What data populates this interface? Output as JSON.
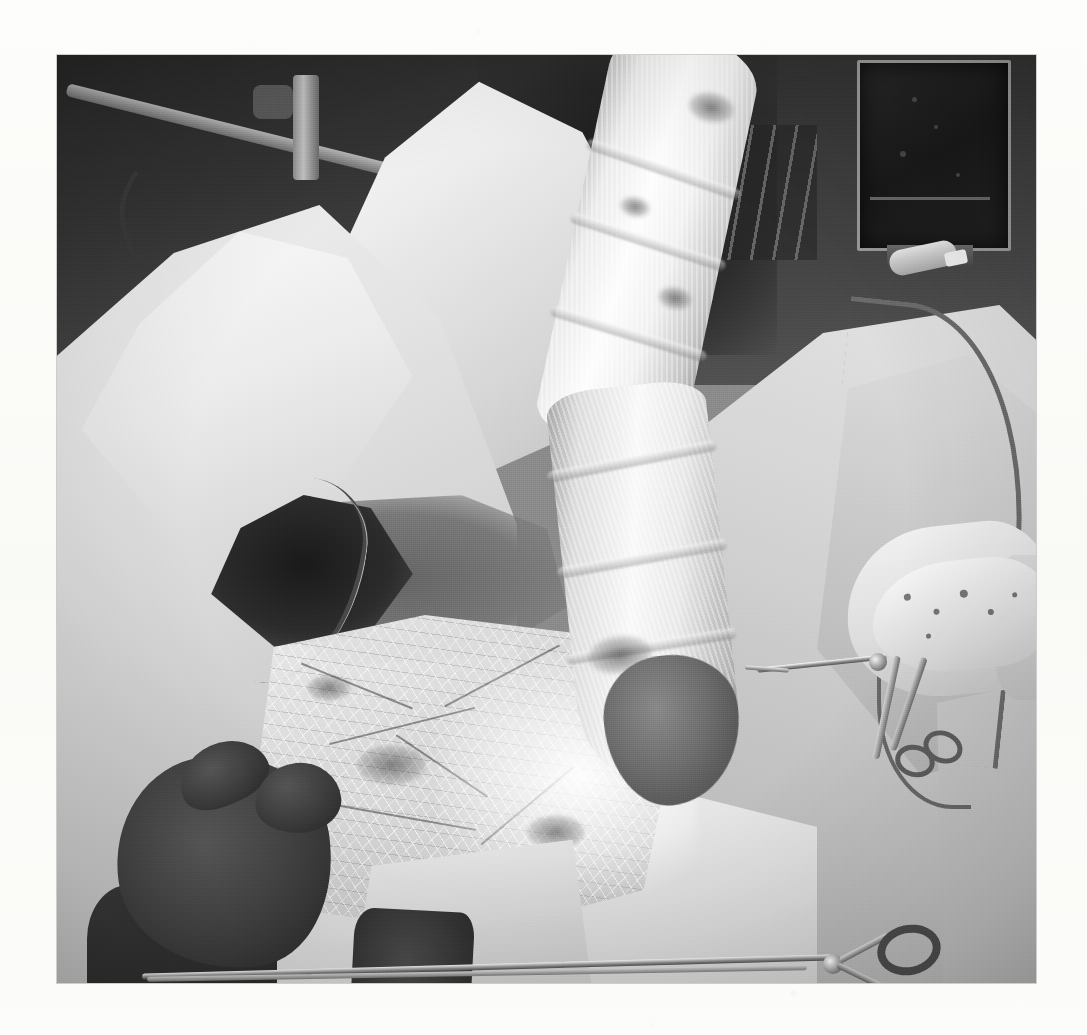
{
  "page": {
    "background_color": "#fbfbf9",
    "width": 1087,
    "height": 1035,
    "media": "scanned printed page",
    "caption": "",
    "figure_label": ""
  },
  "photograph": {
    "name": "intraoperative-surgical-photograph",
    "color_mode": "black-and-white",
    "frame": {
      "left": 57,
      "top": 55,
      "width": 979,
      "height": 928
    },
    "border_color": "#8c8c8c",
    "description": "Intraoperative view of an operating field: a large gauze-bandaged limb crosses the frame diagonally from the upper right toward the centre, surrounded by white surgical drapes, with gloved hands and instruments.",
    "tones": {
      "paper": "#fbfbf9",
      "highlight_white": "#fdfdfd",
      "drape_light": "#ededed",
      "drape_mid": "#c7c7c7",
      "drape_shadow": "#a8a8a8",
      "midtone": "#8c8c8c",
      "background_dark": "#2e2e2e",
      "deep_black": "#1c1c1c"
    }
  },
  "scene_elements": [
    {
      "id": "bandaged-limb",
      "label": "Bandaged limb",
      "note": "Gauze-wrapped extremity running diagonally from top-right to centre; visible wrap seams and soiled patches.",
      "region": "upper-right to centre"
    },
    {
      "id": "surgical-drape-left",
      "label": "Surgical drape (left)",
      "note": "Large folded white drape covering the left half of the field.",
      "region": "left"
    },
    {
      "id": "surgical-drape-top",
      "label": "Surgical drape (upper centre)",
      "note": "Crumpled white drape peak rising against the dark background.",
      "region": "upper centre"
    },
    {
      "id": "surgical-drape-right",
      "label": "Surgical drape (right)",
      "note": "Grey drape sheeting sloping to the lower right.",
      "region": "right"
    },
    {
      "id": "surgical-field-mesh",
      "label": "Exposed surgical field / mesh dressing",
      "note": "Bright translucent mesh-textured dressing with suture lines over the wound area.",
      "region": "centre-left"
    },
    {
      "id": "wound-opening",
      "label": "Dark wound opening",
      "note": "Deep shadowed cavity with a drain tube passing through it.",
      "region": "centre-left"
    },
    {
      "id": "gloved-hand-left",
      "label": "Gloved hand (assistant, lower left)",
      "note": "Dark surgical glove, thumb and fingers flexed toward the field.",
      "region": "lower left"
    },
    {
      "id": "gloved-hand-right",
      "label": "Gloved hand holding clamp (right)",
      "note": "Light gown cuff and glove gripping a haemostatic clamp.",
      "region": "right centre"
    },
    {
      "id": "surgical-clamp",
      "label": "Haemostatic clamp / forceps",
      "note": "Ringed clamp pointing left into the bandaged limb.",
      "region": "right centre"
    },
    {
      "id": "surgical-scissors",
      "label": "Long surgical scissors",
      "note": "Ring-handled scissors lying across the drape at the bottom of the frame.",
      "region": "bottom"
    },
    {
      "id": "drain-tubing",
      "label": "Drain / suction tubing",
      "note": "Curved dark tubing looping across the right drape and through the wound.",
      "region": "right and centre-left"
    },
    {
      "id": "gauze-pad",
      "label": "Gauze pad / swab",
      "note": "Soiled rectangular swab resting on the drape near the lower edge.",
      "region": "bottom centre-left"
    },
    {
      "id": "or-monitor",
      "label": "Operating room monitor",
      "note": "Dark CRT-style screen with a light bezel in the background.",
      "region": "top right"
    },
    {
      "id": "iv-pole",
      "label": "Equipment pole and cabling",
      "note": "Metal arm, vertical post and coiled cable silhouetted against the dark background.",
      "region": "top left"
    },
    {
      "id": "instrument-tray",
      "label": "Background instrument rack",
      "note": "Blurred shelving and a white container behind the drape peak.",
      "region": "top centre"
    },
    {
      "id": "syringe",
      "label": "Syringe on tray",
      "note": "Small light cylinder with a tip lying on the background tray.",
      "region": "upper right"
    }
  ]
}
